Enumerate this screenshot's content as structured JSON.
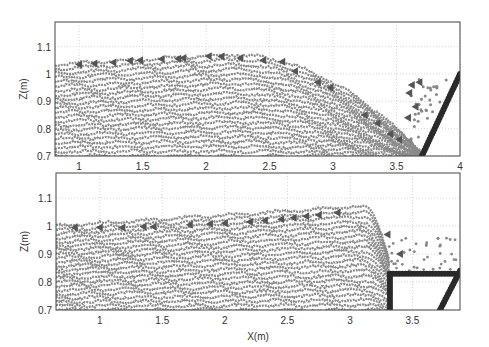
{
  "chart_data": [
    {
      "type": "scatter",
      "title": "",
      "xlabel": "",
      "ylabel": "Z(m)",
      "xlim": [
        0.81,
        4.0
      ],
      "ylim": [
        0.7,
        1.19
      ],
      "xticks": [
        "1",
        "1.5",
        "2",
        "2.5",
        "3",
        "3.5",
        "4"
      ],
      "yticks": [
        "0.7",
        "0.8",
        "0.9",
        "1",
        "1.1"
      ],
      "grid": true,
      "series": [
        {
          "name": "free-surface",
          "marker": "triangle-left",
          "x": [
            1.0,
            1.12,
            1.27,
            1.4,
            1.48,
            1.65,
            1.78,
            1.82,
            2.02,
            2.12,
            2.27,
            2.45,
            2.6,
            2.7,
            2.88,
            2.98,
            3.25,
            3.35,
            3.45,
            3.52
          ],
          "y": [
            1.035,
            1.038,
            1.042,
            1.048,
            1.05,
            1.055,
            1.056,
            1.058,
            1.065,
            1.064,
            1.058,
            1.05,
            1.045,
            1.01,
            0.97,
            0.95,
            0.85,
            0.82,
            0.78,
            0.76
          ]
        },
        {
          "name": "splash",
          "marker": "triangle-left",
          "x": [
            3.62,
            3.68,
            3.6,
            3.65,
            3.59
          ],
          "y": [
            0.96,
            0.97,
            0.93,
            0.88,
            0.84
          ]
        },
        {
          "name": "wall",
          "marker": "circle",
          "x": [
            3.7,
            4.0
          ],
          "y": [
            0.7,
            1.0
          ]
        }
      ]
    },
    {
      "type": "scatter",
      "title": "",
      "xlabel": "X(m)",
      "ylabel": "Z(m)",
      "xlim": [
        0.65,
        3.88
      ],
      "ylim": [
        0.7,
        1.19
      ],
      "xticks": [
        "1",
        "1.5",
        "2",
        "2.5",
        "3",
        "3.5"
      ],
      "yticks": [
        "0.7",
        "0.8",
        "0.9",
        "1",
        "1.1"
      ],
      "grid": true,
      "series": [
        {
          "name": "free-surface",
          "marker": "triangle-left",
          "x": [
            0.8,
            1.0,
            1.18,
            1.35,
            1.43,
            1.72,
            1.88,
            2.0,
            2.2,
            2.32,
            2.45,
            2.55,
            2.65,
            2.75,
            2.9,
            3.3,
            3.4
          ],
          "y": [
            0.995,
            0.995,
            0.995,
            0.998,
            0.998,
            1.005,
            1.008,
            1.01,
            1.015,
            1.02,
            1.025,
            1.03,
            1.035,
            1.04,
            1.048,
            0.97,
            0.9
          ]
        },
        {
          "name": "obstacle",
          "marker": "circle",
          "x": [
            3.32,
            3.32,
            3.88
          ],
          "y": [
            0.7,
            0.83,
            0.83
          ]
        },
        {
          "name": "wall",
          "marker": "circle",
          "x": [
            3.72,
            3.88
          ],
          "y": [
            0.7,
            0.84
          ]
        }
      ]
    }
  ]
}
